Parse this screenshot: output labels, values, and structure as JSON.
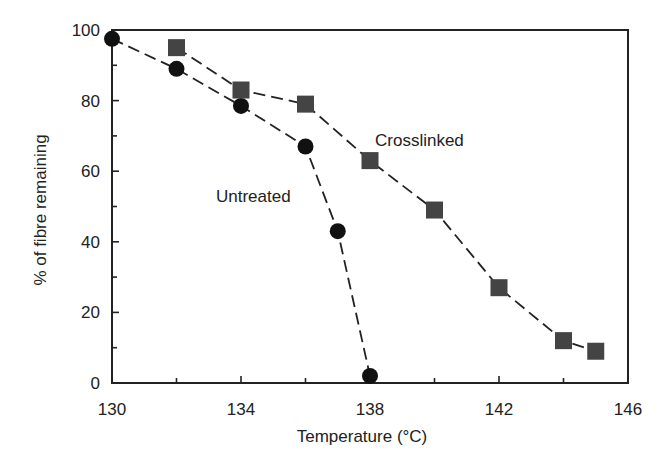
{
  "chart_data": {
    "type": "line",
    "title": "",
    "xlabel": "Temperature (°C)",
    "ylabel": "% of fibre remaining",
    "xlim": [
      130,
      146
    ],
    "ylim": [
      0,
      100
    ],
    "xticks": [
      130,
      134,
      138,
      142,
      146
    ],
    "xminor_ticks": [
      132,
      136,
      140,
      144
    ],
    "yticks": [
      0,
      20,
      40,
      60,
      80,
      100
    ],
    "yminor_ticks": [
      10,
      30,
      50,
      70,
      90
    ],
    "grid": false,
    "legend": "inline labels",
    "series": [
      {
        "name": "Untreated",
        "marker": "circle",
        "line_style": "dashed",
        "color": "#111111",
        "x": [
          130,
          132,
          134,
          136,
          137,
          138
        ],
        "values": [
          97.5,
          89,
          78.5,
          67,
          43,
          2
        ]
      },
      {
        "name": "Crosslinked",
        "marker": "square",
        "line_style": "dashed",
        "color": "#444444",
        "x": [
          132,
          134,
          136,
          138,
          140,
          142,
          144,
          145
        ],
        "values": [
          95,
          83,
          79,
          63,
          49,
          27,
          12,
          9
        ]
      }
    ],
    "annotations": [
      {
        "text": "Crosslinked",
        "x": 139,
        "y": 69
      },
      {
        "text": "Untreated",
        "x": 135.5,
        "y": 53
      }
    ]
  },
  "axes": {
    "xlabel": "Temperature (°C)",
    "ylabel": "% of fibre remaining",
    "xtick_labels": [
      "130",
      "134",
      "138",
      "142",
      "146"
    ],
    "ytick_labels": [
      "0",
      "20",
      "40",
      "60",
      "80",
      "100"
    ]
  },
  "labels": {
    "crosslinked": "Crosslinked",
    "untreated": "Untreated"
  }
}
